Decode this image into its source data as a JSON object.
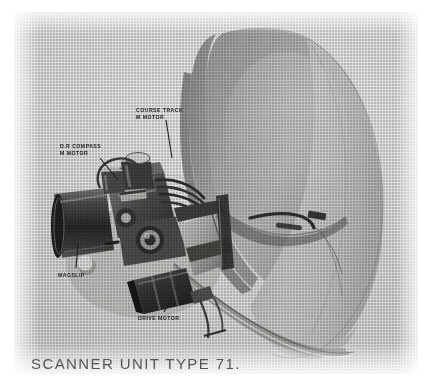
{
  "figure": {
    "caption": "SCANNER UNIT TYPE 71.",
    "medium": "halftone-printed black-and-white photograph",
    "colors": {
      "page_background": "#ffffff",
      "plate_background": "#d4d4d2",
      "dish_light": "#cdcdcb",
      "dish_mid": "#b4b4b2",
      "dish_shadow": "#8e8e8c",
      "metal_dark": "#3a3a3a",
      "metal_mid": "#6e6e6e",
      "metal_light": "#c8c8c6",
      "label_text": "#1a1a1a",
      "caption_text": "#4a4a4a",
      "leader_line": "#232323"
    }
  },
  "callouts": [
    {
      "name": "course-track-m-motor",
      "line1": "COURSE  TRACK",
      "line2": "M  MOTOR"
    },
    {
      "name": "dr-compass-m-motor",
      "line1": "D.R COMPASS",
      "line2": "M MOTOR"
    },
    {
      "name": "magslip",
      "line1": "MAGSLIP",
      "line2": ""
    },
    {
      "name": "drive-motor",
      "line1": "DRIVE   MOTOR",
      "line2": ""
    }
  ],
  "components": {
    "dish": "parabolic-reflector-antenna",
    "feed_horn": "waveguide-feed-arm",
    "gearbox": "central-gearbox-assembly",
    "cylinder_motor": "magslip-cylindrical-housing",
    "drive_motor_unit": "drive-motor-housing",
    "cable_loom": "cable-harness"
  }
}
